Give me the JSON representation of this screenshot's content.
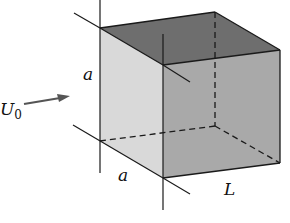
{
  "diagram": {
    "type": "3D cube / rectangular box in a flow",
    "labels": {
      "flow_velocity": "U",
      "flow_velocity_subscript": "0",
      "height": "a",
      "width": "a",
      "length": "L"
    },
    "colors": {
      "left_face": "#d9d9d9",
      "top_face": "#6e6e6e",
      "right_face": "#a9a9a9",
      "edges": "#1a1a1a",
      "arrow": "#555555"
    }
  }
}
